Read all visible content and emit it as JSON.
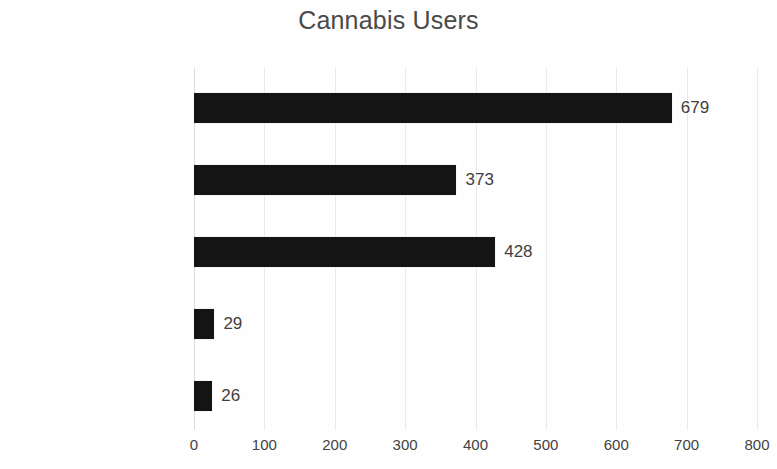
{
  "chart_data": {
    "type": "bar",
    "orientation": "horizontal",
    "title": "Cannabis Users",
    "xlabel": "",
    "ylabel": "",
    "categories": [
      "Medically Prescribed",
      "Self-Medicating",
      "Recreational",
      "Religious",
      "Other"
    ],
    "values": [
      679,
      373,
      428,
      29,
      26
    ],
    "data_labels": [
      "679",
      "373",
      "428",
      "29",
      "26"
    ],
    "xlim": [
      0,
      800
    ],
    "xticks": [
      0,
      100,
      200,
      300,
      400,
      500,
      600,
      700,
      800
    ],
    "xtick_labels": [
      "0",
      "100",
      "200",
      "300",
      "400",
      "500",
      "600",
      "700",
      "800"
    ],
    "grid": "vertical",
    "legend": "none",
    "bar_color": "#141414",
    "gridline_color": "#e9e9e9",
    "title_color": "#4a4a4a",
    "label_color": "#3d3d3d"
  }
}
